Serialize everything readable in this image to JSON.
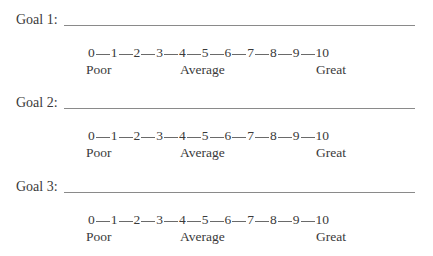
{
  "goals": [
    {
      "label": "Goal 1:",
      "scale": [
        "0",
        "1",
        "2",
        "3",
        "4",
        "5",
        "6",
        "7",
        "8",
        "9",
        "10"
      ],
      "anchors": {
        "low": "Poor",
        "mid": "Average",
        "high": "Great"
      }
    },
    {
      "label": "Goal 2:",
      "scale": [
        "0",
        "1",
        "2",
        "3",
        "4",
        "5",
        "6",
        "7",
        "8",
        "9",
        "10"
      ],
      "anchors": {
        "low": "Poor",
        "mid": "Average",
        "high": "Great"
      }
    },
    {
      "label": "Goal 3:",
      "scale": [
        "0",
        "1",
        "2",
        "3",
        "4",
        "5",
        "6",
        "7",
        "8",
        "9",
        "10"
      ],
      "anchors": {
        "low": "Poor",
        "mid": "Average",
        "high": "Great"
      }
    }
  ]
}
